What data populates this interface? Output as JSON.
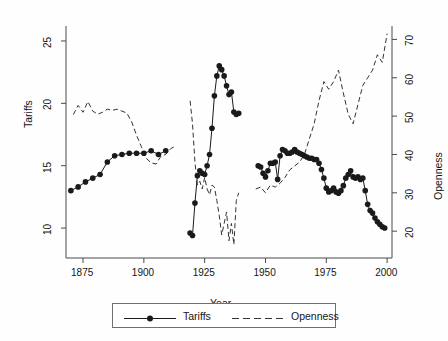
{
  "figure": {
    "width": 448,
    "height": 341,
    "background": "#fefefe",
    "frame_color": "#4a4a4a",
    "series_color": "#1a1a1a"
  },
  "axes": {
    "x": {
      "label": "Year",
      "ticks": [
        1875,
        1900,
        1925,
        1950,
        1975,
        2000
      ],
      "tick_labels": [
        "1875",
        "1900",
        "1925",
        "1950",
        "1975",
        "2000"
      ],
      "range": [
        1868,
        2002
      ]
    },
    "y_left": {
      "label": "Tariffs",
      "ticks": [
        10,
        15,
        20,
        25
      ],
      "tick_labels": [
        "10",
        "15",
        "20",
        "25"
      ],
      "range": [
        7.6,
        26.2
      ]
    },
    "y_right": {
      "label": "Openness",
      "ticks": [
        20,
        30,
        40,
        50,
        60,
        70
      ],
      "tick_labels": [
        "20",
        "30",
        "40",
        "50",
        "60",
        "70"
      ],
      "range": [
        13.0,
        73.5
      ]
    },
    "grid": false
  },
  "legend": {
    "position": "below-axes",
    "entries": [
      {
        "label": "Tariffs",
        "style": "solid-with-markers"
      },
      {
        "label": "Openness",
        "style": "dashed"
      }
    ]
  },
  "chart_data": {
    "type": "line",
    "title": "",
    "subtitle": "",
    "xlabel": "Year",
    "ylabel": "Tariffs",
    "y2label": "Openness",
    "xlim": [
      1868,
      2002
    ],
    "ylim": [
      7.6,
      26.2
    ],
    "y2lim": [
      13.0,
      73.5
    ],
    "grid": false,
    "legend_position": "below",
    "series": [
      {
        "name": "Tariffs",
        "axis": "left",
        "style": "solid",
        "marker": "filled-circle",
        "color": "#1a1a1a",
        "x": [
          1870,
          1873,
          1876,
          1879,
          1882,
          1885,
          1888,
          1891,
          1894,
          1897,
          1900,
          1903,
          1906,
          1909,
          1919,
          1920,
          1921,
          1922,
          1923,
          1924,
          1925,
          1926,
          1927,
          1928,
          1929,
          1930,
          1931,
          1932,
          1933,
          1934,
          1935,
          1936,
          1937,
          1938,
          1939,
          1947,
          1948,
          1949,
          1950,
          1951,
          1952,
          1953,
          1954,
          1955,
          1956,
          1957,
          1958,
          1959,
          1960,
          1961,
          1962,
          1963,
          1964,
          1965,
          1966,
          1967,
          1968,
          1969,
          1970,
          1971,
          1972,
          1973,
          1974,
          1975,
          1976,
          1977,
          1978,
          1979,
          1980,
          1981,
          1982,
          1983,
          1984,
          1985,
          1986,
          1987,
          1988,
          1989,
          1990,
          1991,
          1992,
          1993,
          1994,
          1995,
          1996,
          1997,
          1998,
          1999
        ],
        "y": [
          13.0,
          13.3,
          13.7,
          14.0,
          14.3,
          15.3,
          15.8,
          15.9,
          16.0,
          16.0,
          16.0,
          16.2,
          15.9,
          16.2,
          9.6,
          9.4,
          12.0,
          14.2,
          14.6,
          14.4,
          14.3,
          15.0,
          15.9,
          18.0,
          20.6,
          22.2,
          23.0,
          22.7,
          22.2,
          21.4,
          20.7,
          20.9,
          19.3,
          19.1,
          19.2,
          15.0,
          14.9,
          14.4,
          14.1,
          14.6,
          15.2,
          15.2,
          15.3,
          13.9,
          15.8,
          16.3,
          16.2,
          16.0,
          16.0,
          16.1,
          16.3,
          16.1,
          16.0,
          15.9,
          15.8,
          15.7,
          15.6,
          15.6,
          15.5,
          15.5,
          15.2,
          14.7,
          14.0,
          13.2,
          12.9,
          13.0,
          13.2,
          12.9,
          12.8,
          13.0,
          13.4,
          14.0,
          14.3,
          14.6,
          14.1,
          14.0,
          14.1,
          13.9,
          14.0,
          13.0,
          11.9,
          11.4,
          11.2,
          10.8,
          10.5,
          10.3,
          10.1,
          10.0
        ]
      },
      {
        "name": "Openness",
        "axis": "right",
        "style": "dashed",
        "marker": "none",
        "color": "#333333",
        "x": [
          1871,
          1873,
          1875,
          1877,
          1879,
          1881,
          1883,
          1885,
          1887,
          1889,
          1891,
          1893,
          1895,
          1897,
          1899,
          1901,
          1903,
          1905,
          1907,
          1909,
          1911,
          1913,
          1919,
          1920,
          1921,
          1922,
          1923,
          1924,
          1925,
          1926,
          1927,
          1928,
          1929,
          1930,
          1931,
          1932,
          1933,
          1934,
          1935,
          1936,
          1937,
          1938,
          1939,
          1946,
          1948,
          1950,
          1952,
          1954,
          1956,
          1958,
          1960,
          1962,
          1964,
          1966,
          1968,
          1970,
          1972,
          1974,
          1976,
          1978,
          1980,
          1982,
          1984,
          1986,
          1988,
          1990,
          1992,
          1994,
          1996,
          1998,
          2000
        ],
        "y": [
          50.4,
          52.8,
          51.0,
          53.8,
          51.3,
          50.5,
          51.0,
          51.8,
          51.5,
          51.8,
          51.3,
          50.8,
          48.5,
          45.0,
          42.0,
          39.0,
          37.8,
          37.5,
          39.5,
          40.0,
          41.5,
          42.2,
          54.0,
          48.0,
          38.0,
          32.0,
          33.0,
          31.0,
          34.0,
          31.0,
          29.5,
          32.0,
          31.5,
          28.0,
          24.0,
          19.0,
          22.0,
          25.0,
          17.5,
          22.0,
          16.5,
          28.0,
          30.0,
          31.0,
          31.5,
          30.0,
          32.0,
          31.5,
          32.5,
          34.0,
          36.0,
          37.0,
          38.0,
          40.0,
          44.0,
          48.0,
          54.0,
          59.0,
          57.0,
          59.0,
          62.0,
          56.0,
          50.5,
          48.0,
          53.0,
          58.0,
          60.0,
          62.0,
          66.0,
          64.0,
          71.5
        ]
      }
    ]
  }
}
